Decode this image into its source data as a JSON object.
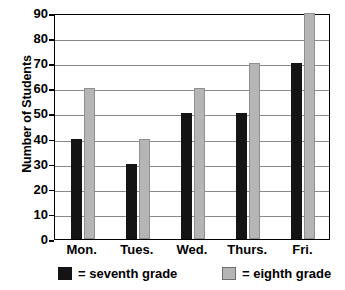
{
  "chart_data": {
    "type": "bar",
    "title": "",
    "xlabel": "",
    "ylabel": "Number of Students",
    "categories": [
      "Mon.",
      "Tues.",
      "Wed.",
      "Thurs.",
      "Fri."
    ],
    "series": [
      {
        "name": "= seventh grade",
        "key": "seventh",
        "color": "#141414",
        "values": [
          40,
          30,
          50,
          50,
          70
        ]
      },
      {
        "name": "= eighth grade",
        "key": "eighth",
        "color": "#b5b5b5",
        "values": [
          60,
          40,
          60,
          70,
          90
        ]
      }
    ],
    "ylim": [
      0,
      90
    ],
    "ytick_labels": [
      "90",
      "80",
      "70",
      "60",
      "50",
      "40",
      "30",
      "20",
      "10",
      "0"
    ],
    "ytick_values": [
      90,
      80,
      70,
      60,
      50,
      40,
      30,
      20,
      10,
      0
    ],
    "ytick_step": 10,
    "grid": true,
    "grid_axis": "y",
    "legend_position": "bottom",
    "legend": [
      {
        "label": "= seventh grade",
        "swatch_color": "#141414"
      },
      {
        "label": "= eighth grade",
        "swatch_color": "#b5b5b5"
      }
    ],
    "background_color": "#ffffff",
    "axis_color": "#000000",
    "gridline_color": "#8a8a8a"
  }
}
